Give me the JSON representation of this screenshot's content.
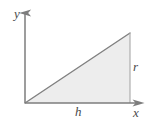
{
  "figure": {
    "background_color": "#ffffff",
    "axes": {
      "x_axis_label": "x",
      "y_axis_label": "y",
      "axis_color": "#7d7d7d",
      "origin": {
        "x": 25,
        "y": 103
      },
      "x_axis_end": {
        "x": 141,
        "y": 103
      },
      "y_axis_end": {
        "x": 25,
        "y": 9
      },
      "arrowheads": true
    },
    "shape": {
      "type": "triangle",
      "fill_color": "#ededed",
      "stroke_color": "#808080",
      "vertices": [
        {
          "x": 25,
          "y": 103
        },
        {
          "x": 130,
          "y": 103
        },
        {
          "x": 130,
          "y": 33
        }
      ]
    },
    "dimension_labels": {
      "base_label": "h",
      "height_label": "r"
    }
  }
}
